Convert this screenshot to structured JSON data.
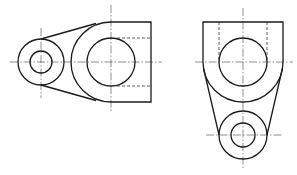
{
  "drawing": {
    "type": "orthographic-views",
    "colors": {
      "line": "#1a1a1a",
      "background": "#ffffff"
    },
    "views": [
      {
        "name": "front-view",
        "small_boss": {
          "cx": 41,
          "cy": 62,
          "r_outer": 23,
          "r_inner": 11
        },
        "large_boss": {
          "cx": 111,
          "cy": 62,
          "r_arc": 40,
          "r_hole": 24
        },
        "block": {
          "x1": 111,
          "y1": 22,
          "x2": 151,
          "y2": 102
        },
        "hidden_lines_y": [
          38,
          86
        ]
      },
      {
        "name": "side-view",
        "upper_block": {
          "x1": 203,
          "y1": 22,
          "x2": 283,
          "cy": 62,
          "r": 40
        },
        "upper_hole": {
          "cx": 243,
          "cy": 62,
          "r": 24
        },
        "lower_boss": {
          "cx": 243,
          "cy": 135,
          "r_outer": 24,
          "r_inner": 12
        },
        "hidden_lines_x": [
          219,
          267
        ]
      }
    ]
  }
}
